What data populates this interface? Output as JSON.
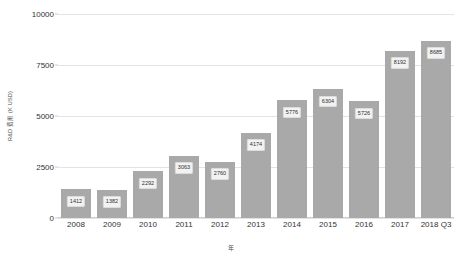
{
  "chart_data": {
    "type": "bar",
    "title": "",
    "xlabel": "年",
    "ylabel": "R&D 费用 (K USD)",
    "categories": [
      "2008",
      "2009",
      "2010",
      "2011",
      "2012",
      "2013",
      "2014",
      "2015",
      "2016",
      "2017",
      "2018 Q3"
    ],
    "values": [
      1412,
      1382,
      2292,
      3063,
      2760,
      4174,
      5776,
      6304,
      5726,
      8192,
      8685
    ],
    "value_labels": [
      "1412",
      "1382",
      "2292",
      "3063",
      "2760",
      "4174",
      "5776",
      "6304",
      "5726",
      "8192",
      "8685"
    ],
    "ylim": [
      0,
      10000
    ],
    "yticks": [
      0,
      2500,
      5000,
      7500,
      10000
    ],
    "ytick_labels": [
      "0",
      "2500",
      "5000",
      "7500",
      "10000"
    ],
    "grid": true,
    "legend": false,
    "series": [
      {
        "name": "R&D 费用",
        "color": "#a9a9a9",
        "values": [
          1412,
          1382,
          2292,
          3063,
          2760,
          4174,
          5776,
          6304,
          5726,
          8192,
          8685
        ]
      }
    ],
    "colors": {
      "bar": "#a9a9a9",
      "gridline": "#e3e3e3",
      "axis": "#cfcfcf",
      "label_background": "#f2f2f2",
      "label_border": "#dcdcdc",
      "text": "#333333"
    }
  }
}
